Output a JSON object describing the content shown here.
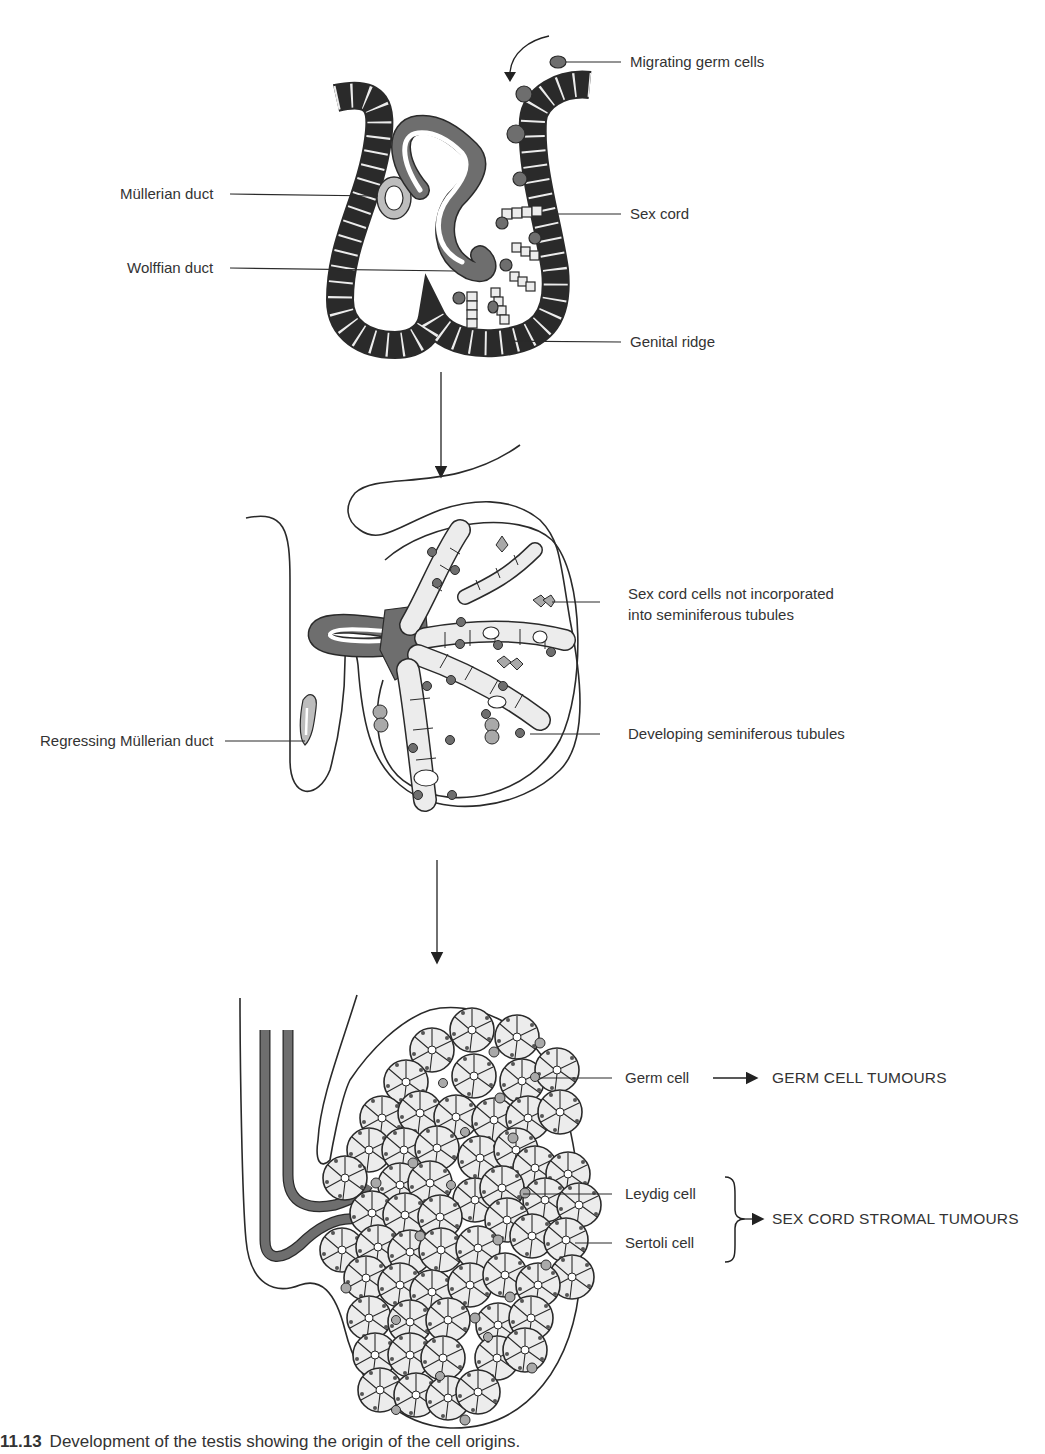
{
  "figure": {
    "caption_number": "11.13",
    "caption_text": "Development of the testis showing the origin of the cell origins."
  },
  "stage1": {
    "labels": {
      "migrating_germ_cells": "Migrating germ cells",
      "mullerian_duct": "Müllerian duct",
      "sex_cord": "Sex cord",
      "wolffian_duct": "Wolffian duct",
      "genital_ridge": "Genital ridge"
    }
  },
  "stage2": {
    "labels": {
      "sex_cord_cells_line1": "Sex cord cells not incorporated",
      "sex_cord_cells_line2": "into seminiferous tubules",
      "regressing_mullerian_duct": "Regressing Müllerian duct",
      "developing_tubules": "Developing seminiferous tubules"
    }
  },
  "stage3": {
    "labels": {
      "germ_cell": "Germ cell",
      "leydig_cell": "Leydig cell",
      "sertoli_cell": "Sertoli cell"
    },
    "outcomes": {
      "germ_cell_tumours": "GERM CELL TUMOURS",
      "sex_cord_stromal_tumours": "SEX CORD STROMAL TUMOURS"
    }
  },
  "colors": {
    "dark_fill": "#6e6e6e",
    "light_fill": "#ececec",
    "mid_fill": "#a9a9a9",
    "line": "#2a2a2a"
  }
}
